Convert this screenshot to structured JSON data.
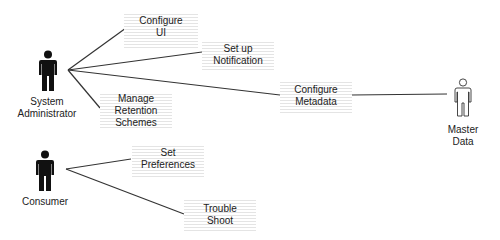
{
  "diagram": {
    "type": "use-case",
    "actors": [
      {
        "id": "sysadmin",
        "label_lines": [
          "System",
          "Administrator"
        ],
        "style": "filled"
      },
      {
        "id": "consumer",
        "label_lines": [
          "Consumer"
        ],
        "style": "filled"
      },
      {
        "id": "masterdata",
        "label_lines": [
          "Master",
          "Data"
        ],
        "style": "outline"
      }
    ],
    "use_cases": [
      {
        "id": "configure-ui",
        "lines": [
          "Configure",
          "UI"
        ]
      },
      {
        "id": "setup-notification",
        "lines": [
          "Set up",
          "Notification"
        ]
      },
      {
        "id": "manage-retention",
        "lines": [
          "Manage",
          "Retention",
          "Schemes"
        ]
      },
      {
        "id": "configure-metadata",
        "lines": [
          "Configure",
          "Metadata"
        ]
      },
      {
        "id": "set-preferences",
        "lines": [
          "Set",
          "Preferences"
        ]
      },
      {
        "id": "trouble-shoot",
        "lines": [
          "Trouble",
          "Shoot"
        ]
      }
    ],
    "associations": [
      [
        "sysadmin",
        "configure-ui"
      ],
      [
        "sysadmin",
        "setup-notification"
      ],
      [
        "sysadmin",
        "configure-metadata"
      ],
      [
        "sysadmin",
        "manage-retention"
      ],
      [
        "configure-metadata",
        "masterdata"
      ],
      [
        "consumer",
        "set-preferences"
      ],
      [
        "consumer",
        "trouble-shoot"
      ]
    ]
  }
}
